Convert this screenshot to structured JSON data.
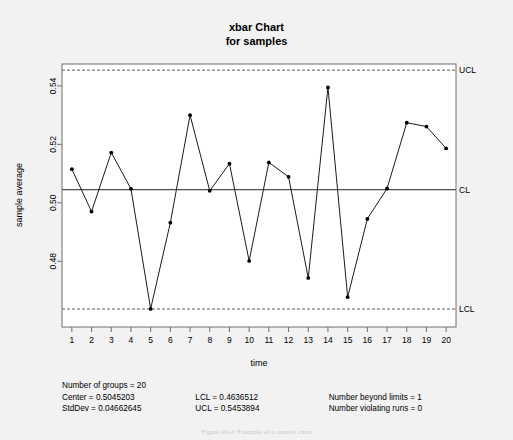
{
  "chart_data": {
    "type": "line",
    "title": "xbar Chart",
    "subtitle": "for samples",
    "xlabel": "time",
    "ylabel": "sample average",
    "categories": [
      1,
      2,
      3,
      4,
      5,
      6,
      7,
      8,
      9,
      10,
      11,
      12,
      13,
      14,
      15,
      16,
      17,
      18,
      19,
      20
    ],
    "values": [
      0.5115,
      0.497,
      0.5172,
      0.5048,
      0.4637,
      0.4932,
      0.53,
      0.5041,
      0.5134,
      0.4801,
      0.5138,
      0.5089,
      0.4743,
      0.5395,
      0.4677,
      0.4945,
      0.5049,
      0.5274,
      0.5261,
      0.5186
    ],
    "ylim": [
      0.4575,
      0.5475
    ],
    "xlim": [
      0.5,
      20.5
    ],
    "yticks": [
      "0.48",
      "0.50",
      "0.52",
      "0.54"
    ],
    "ytickvals": [
      0.48,
      0.5,
      0.52,
      0.54
    ],
    "xticks": [
      "1",
      "2",
      "3",
      "4",
      "5",
      "6",
      "7",
      "8",
      "9",
      "10",
      "11",
      "12",
      "13",
      "14",
      "15",
      "16",
      "17",
      "18",
      "19",
      "20"
    ],
    "grid": false,
    "legend": "none",
    "reference_lines": [
      {
        "name": "UCL",
        "label": "UCL",
        "value": 0.5453894,
        "style": "dashed"
      },
      {
        "name": "CL",
        "label": "CL",
        "value": 0.5045203,
        "style": "solid"
      },
      {
        "name": "LCL",
        "label": "LCL",
        "value": 0.4636512,
        "style": "dashed"
      }
    ],
    "marker": "filled-circle",
    "line_color": "#000000",
    "point_beyond_limits_index": 5
  },
  "statistics": {
    "col1": [
      "Number of groups = 20",
      "Center = 0.5045203",
      "StdDev = 0.04662645"
    ],
    "col2": [
      "",
      "LCL = 0.4636512",
      "UCL = 0.5453894"
    ],
    "col3": [
      "",
      "Number beyond limits = 1",
      "Number violating runs = 0"
    ]
  },
  "caption": "Figure 20.4: Exemple of a control chart"
}
